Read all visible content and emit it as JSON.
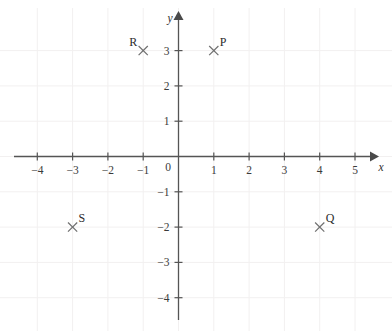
{
  "chart_data": {
    "type": "scatter",
    "title": "",
    "subtitle": "",
    "xlabel": "x",
    "ylabel": "y",
    "xlim": [
      -4.6,
      5.5
    ],
    "ylim": [
      -4.6,
      3.6
    ],
    "grid": true,
    "legend_position": "none",
    "x_tick_labels": [
      "-4",
      "-3",
      "-2",
      "-1",
      "0",
      "1",
      "2",
      "3",
      "4",
      "5"
    ],
    "x_tick_values": [
      -4,
      -3,
      -2,
      -1,
      0,
      1,
      2,
      3,
      4,
      5
    ],
    "y_tick_labels": [
      "3",
      "2",
      "1",
      "-1",
      "-2",
      "-3",
      "-4"
    ],
    "y_tick_values": [
      3,
      2,
      1,
      -1,
      -2,
      -3,
      -4
    ],
    "origin_label": "0",
    "marker": "x-cross",
    "points": [
      {
        "name": "P",
        "x": 1,
        "y": 3,
        "label": "P",
        "label_side": "right"
      },
      {
        "name": "R",
        "x": -1,
        "y": 3,
        "label": "R",
        "label_side": "left"
      },
      {
        "name": "S",
        "x": -3,
        "y": -2,
        "label": "S",
        "label_side": "right"
      },
      {
        "name": "Q",
        "x": 4,
        "y": -2,
        "label": "Q",
        "label_side": "right"
      }
    ],
    "colors": {
      "axis": "#555555",
      "grid": "#f2f0f0",
      "marker": "#6e6e6e",
      "text": "#2f2f2f",
      "background": "#ffffff"
    }
  },
  "axes": {
    "x_axis_name": "x",
    "y_axis_name": "y",
    "origin": "0"
  },
  "ticks": {
    "x": [
      {
        "label": "-4",
        "value": -4
      },
      {
        "label": "-3",
        "value": -3
      },
      {
        "label": "-2",
        "value": -2
      },
      {
        "label": "-1",
        "value": -1
      },
      {
        "label": "1",
        "value": 1
      },
      {
        "label": "2",
        "value": 2
      },
      {
        "label": "3",
        "value": 3
      },
      {
        "label": "4",
        "value": 4
      },
      {
        "label": "5",
        "value": 5
      }
    ],
    "y": [
      {
        "label": "3",
        "value": 3
      },
      {
        "label": "2",
        "value": 2
      },
      {
        "label": "1",
        "value": 1
      },
      {
        "label": "-1",
        "value": -1
      },
      {
        "label": "-2",
        "value": -2
      },
      {
        "label": "-3",
        "value": -3
      },
      {
        "label": "-4",
        "value": -4
      }
    ]
  },
  "points": {
    "p": {
      "label": "P"
    },
    "q": {
      "label": "Q"
    },
    "r": {
      "label": "R"
    },
    "s": {
      "label": "S"
    }
  }
}
